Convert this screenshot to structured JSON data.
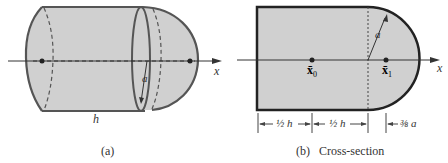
{
  "figure_a": {
    "caption": "(a)",
    "label_h": "h",
    "label_a": "a",
    "label_x": "x"
  },
  "figure_b": {
    "caption": "(b)   Cross-section",
    "label_a": "a",
    "label_x": "x",
    "label_x0": "x̄",
    "sub_x0": "0",
    "label_x1": "x̄",
    "sub_x1": "1",
    "dim_half_h_1": "½ h",
    "dim_half_h_2": "½ h",
    "dim_three_eighths_a": "⅜ a"
  },
  "colors": {
    "fill": "#d0d0d0",
    "outline": "#555555",
    "outline_b": "#222222"
  }
}
